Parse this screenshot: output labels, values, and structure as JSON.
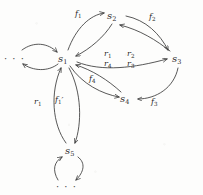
{
  "figure": {
    "type": "directed-graph",
    "background_color": "#fdfdfc",
    "ink_color": "#3a3a3a"
  },
  "nodes": [
    {
      "id": "s1",
      "base": "s",
      "sub": "1",
      "x": 64,
      "y": 58,
      "label": "s1"
    },
    {
      "id": "s2",
      "base": "s",
      "sub": "2",
      "x": 113,
      "y": 15,
      "label": "s2"
    },
    {
      "id": "s3",
      "base": "s",
      "sub": "3",
      "x": 178,
      "y": 58,
      "label": "s3"
    },
    {
      "id": "s4",
      "base": "s",
      "sub": "4",
      "x": 126,
      "y": 98,
      "label": "s4"
    },
    {
      "id": "s5",
      "base": "s",
      "sub": "5",
      "x": 71,
      "y": 150,
      "label": "s5"
    }
  ],
  "ellipses": [
    {
      "id": "left-ellipsis",
      "text": "· · ·",
      "x": 8,
      "y": 58
    },
    {
      "id": "bottom-ellipsis",
      "text": "· · ·",
      "x": 60,
      "y": 186
    }
  ],
  "edge_labels": [
    {
      "id": "f1",
      "base": "f",
      "sub": "1",
      "prime": "",
      "x": 79,
      "y": 13,
      "text": "f1"
    },
    {
      "id": "f2",
      "base": "f",
      "sub": "2",
      "prime": "",
      "x": 153,
      "y": 16,
      "text": "f2"
    },
    {
      "id": "f3",
      "base": "f",
      "sub": "3",
      "prime": "",
      "x": 155,
      "y": 101,
      "text": "f3"
    },
    {
      "id": "f4",
      "base": "f",
      "sub": "4",
      "prime": "",
      "x": 93,
      "y": 78,
      "text": "f4"
    },
    {
      "id": "r1c",
      "base": "r",
      "sub": "1",
      "prime": "",
      "x": 108,
      "y": 53,
      "text": "r1"
    },
    {
      "id": "r2c",
      "base": "r",
      "sub": "2",
      "prime": "",
      "x": 131,
      "y": 53,
      "text": "r2"
    },
    {
      "id": "r4c",
      "base": "r",
      "sub": "4",
      "prime": "",
      "x": 108,
      "y": 63,
      "text": "r4"
    },
    {
      "id": "r3c",
      "base": "r",
      "sub": "3",
      "prime": "",
      "x": 131,
      "y": 63,
      "text": "r3"
    },
    {
      "id": "r1l",
      "base": "r",
      "sub": "1",
      "prime": "",
      "x": 38,
      "y": 101,
      "text": "r1"
    },
    {
      "id": "f1p",
      "base": "f",
      "sub": "1",
      "prime": "′",
      "x": 59,
      "y": 99,
      "text": "f1'"
    }
  ],
  "edges": [
    {
      "id": "s1-to-s2",
      "from": "s1",
      "to": "s2",
      "label": "f1"
    },
    {
      "id": "s2-to-s1",
      "from": "s2",
      "to": "s1",
      "label": "r1"
    },
    {
      "id": "s2-to-s3",
      "from": "s2",
      "to": "s3",
      "label": "f2"
    },
    {
      "id": "s3-to-s2",
      "from": "s3",
      "to": "s2",
      "label": "r2"
    },
    {
      "id": "s3-to-s4",
      "from": "s3",
      "to": "s4",
      "label": "f3"
    },
    {
      "id": "s1-to-s3",
      "from": "s1",
      "to": "s3",
      "label": "r3"
    },
    {
      "id": "s4-to-s1",
      "from": "s4",
      "to": "s1",
      "label": "f4"
    },
    {
      "id": "s1-to-s4",
      "from": "s1",
      "to": "s4",
      "label": "r4"
    },
    {
      "id": "s5-to-s1",
      "from": "s5",
      "to": "s1",
      "label": "r1"
    },
    {
      "id": "s1-to-s5",
      "from": "s1",
      "to": "s5",
      "label": "f1'"
    },
    {
      "id": "ellipsis-to-s1",
      "from": "left-ellipsis",
      "to": "s1",
      "label": ""
    },
    {
      "id": "s1-to-ellipsis",
      "from": "s1",
      "to": "left-ellipsis",
      "label": ""
    },
    {
      "id": "s5-to-ellipsis",
      "from": "s5",
      "to": "bottom-ellipsis",
      "label": ""
    },
    {
      "id": "ellipsis-to-s5",
      "from": "bottom-ellipsis",
      "to": "s5",
      "label": ""
    }
  ]
}
